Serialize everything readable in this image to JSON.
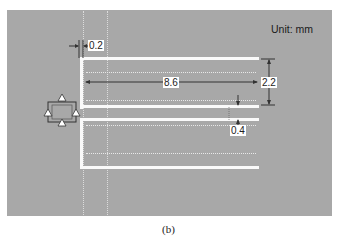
{
  "figure": {
    "caption": "(b)",
    "unit_label": "Unit: mm",
    "background_color": "#a8a8a8",
    "conductor_color": "#fafafa"
  },
  "dimensions": {
    "line_width": "0.2",
    "finger_length": "8.6",
    "finger_width": "2.2",
    "finger_gap": "0.4"
  },
  "components": {
    "port": "port-symbol-with-four-triangle-terminals",
    "structure": "two-finger-interdigital-conductor"
  }
}
